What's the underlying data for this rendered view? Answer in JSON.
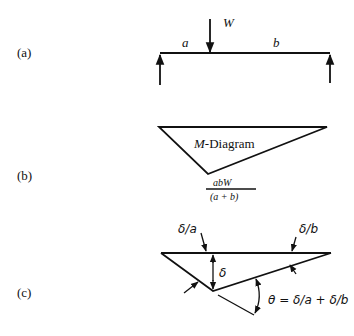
{
  "panels": {
    "a": {
      "label": "(a)",
      "load_label": "W",
      "span_left_label": "a",
      "span_right_label": "b"
    },
    "b": {
      "label": "(b)",
      "diagram_label_italic": "M",
      "diagram_label_rest": "-Diagram",
      "peak_numerator": "abW",
      "peak_denominator": "(a + b)"
    },
    "c": {
      "label": "(c)",
      "left_rotation_label": "δ/a",
      "right_rotation_label": "δ/b",
      "deflection_label": "δ",
      "angle_label": "θ = δ/a + δ/b"
    }
  }
}
